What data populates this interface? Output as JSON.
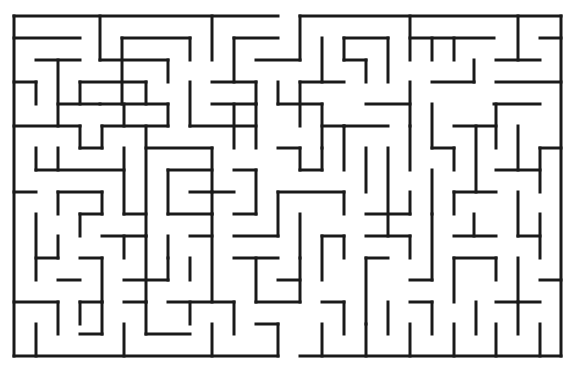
{
  "puzzle": {
    "type": "maze",
    "title": "Maze",
    "wall_color": "#1a1a1a",
    "background_color": "#ffffff",
    "entrance": {
      "side": "top",
      "x_range": [
        278,
        300
      ]
    },
    "exit": {
      "side": "bottom",
      "x_range": [
        278,
        300
      ]
    },
    "walls": [
      [
        14,
        16,
        278,
        16
      ],
      [
        300,
        16,
        561,
        16
      ],
      [
        14,
        16,
        14,
        356
      ],
      [
        561,
        16,
        561,
        356
      ],
      [
        14,
        356,
        278,
        356
      ],
      [
        300,
        356,
        561,
        356
      ],
      [
        14,
        38,
        80,
        38
      ],
      [
        36,
        60,
        80,
        60
      ],
      [
        58,
        60,
        58,
        126
      ],
      [
        36,
        82,
        36,
        104
      ],
      [
        14,
        82,
        36,
        82
      ],
      [
        100,
        16,
        100,
        60
      ],
      [
        122,
        38,
        190,
        38
      ],
      [
        190,
        38,
        190,
        60
      ],
      [
        100,
        60,
        168,
        60
      ],
      [
        168,
        60,
        168,
        82
      ],
      [
        122,
        38,
        122,
        104
      ],
      [
        80,
        82,
        80,
        104
      ],
      [
        80,
        82,
        146,
        82
      ],
      [
        146,
        82,
        146,
        104
      ],
      [
        58,
        104,
        100,
        104
      ],
      [
        100,
        104,
        168,
        104
      ],
      [
        168,
        104,
        168,
        126
      ],
      [
        212,
        16,
        212,
        60
      ],
      [
        234,
        38,
        278,
        38
      ],
      [
        234,
        38,
        234,
        82
      ],
      [
        212,
        82,
        256,
        82
      ],
      [
        256,
        82,
        256,
        104
      ],
      [
        278,
        82,
        278,
        104
      ],
      [
        190,
        82,
        190,
        126
      ],
      [
        300,
        16,
        300,
        60
      ],
      [
        256,
        60,
        300,
        60
      ],
      [
        300,
        82,
        300,
        126
      ],
      [
        300,
        82,
        344,
        82
      ],
      [
        322,
        38,
        322,
        82
      ],
      [
        344,
        38,
        344,
        60
      ],
      [
        344,
        38,
        388,
        38
      ],
      [
        388,
        38,
        388,
        82
      ],
      [
        366,
        60,
        366,
        82
      ],
      [
        344,
        60,
        366,
        60
      ],
      [
        410,
        16,
        410,
        60
      ],
      [
        410,
        38,
        494,
        38
      ],
      [
        432,
        38,
        432,
        60
      ],
      [
        454,
        38,
        454,
        60
      ],
      [
        474,
        60,
        474,
        82
      ],
      [
        432,
        82,
        474,
        82
      ],
      [
        518,
        16,
        518,
        60
      ],
      [
        540,
        38,
        561,
        38
      ],
      [
        496,
        60,
        540,
        60
      ],
      [
        496,
        82,
        561,
        82
      ],
      [
        494,
        104,
        540,
        104
      ],
      [
        14,
        126,
        80,
        126
      ],
      [
        80,
        126,
        80,
        148
      ],
      [
        80,
        148,
        102,
        148
      ],
      [
        102,
        126,
        102,
        148
      ],
      [
        102,
        126,
        168,
        126
      ],
      [
        124,
        104,
        124,
        126
      ],
      [
        190,
        126,
        256,
        126
      ],
      [
        234,
        104,
        234,
        148
      ],
      [
        212,
        104,
        256,
        104
      ],
      [
        256,
        104,
        256,
        148
      ],
      [
        278,
        104,
        322,
        104
      ],
      [
        322,
        104,
        322,
        148
      ],
      [
        322,
        126,
        344,
        126
      ],
      [
        344,
        126,
        388,
        126
      ],
      [
        366,
        104,
        410,
        104
      ],
      [
        410,
        82,
        410,
        126
      ],
      [
        432,
        104,
        432,
        148
      ],
      [
        454,
        126,
        496,
        126
      ],
      [
        496,
        104,
        496,
        148
      ],
      [
        518,
        126,
        518,
        170
      ],
      [
        36,
        148,
        36,
        170
      ],
      [
        58,
        148,
        58,
        170
      ],
      [
        36,
        170,
        124,
        170
      ],
      [
        124,
        148,
        124,
        214
      ],
      [
        146,
        126,
        146,
        236
      ],
      [
        146,
        148,
        212,
        148
      ],
      [
        212,
        148,
        212,
        192
      ],
      [
        168,
        170,
        168,
        214
      ],
      [
        168,
        170,
        212,
        170
      ],
      [
        190,
        192,
        234,
        192
      ],
      [
        212,
        192,
        212,
        214
      ],
      [
        234,
        170,
        256,
        170
      ],
      [
        256,
        170,
        256,
        214
      ],
      [
        278,
        148,
        300,
        148
      ],
      [
        300,
        148,
        300,
        170
      ],
      [
        300,
        170,
        322,
        170
      ],
      [
        322,
        148,
        322,
        170
      ],
      [
        344,
        126,
        344,
        170
      ],
      [
        366,
        148,
        366,
        192
      ],
      [
        388,
        148,
        388,
        236
      ],
      [
        410,
        126,
        410,
        170
      ],
      [
        432,
        148,
        454,
        148
      ],
      [
        454,
        148,
        454,
        170
      ],
      [
        476,
        126,
        476,
        192
      ],
      [
        496,
        170,
        540,
        170
      ],
      [
        540,
        148,
        561,
        148
      ],
      [
        540,
        148,
        540,
        192
      ],
      [
        14,
        192,
        36,
        192
      ],
      [
        58,
        192,
        58,
        214
      ],
      [
        58,
        192,
        102,
        192
      ],
      [
        102,
        192,
        102,
        214
      ],
      [
        124,
        214,
        146,
        214
      ],
      [
        168,
        214,
        212,
        214
      ],
      [
        278,
        192,
        278,
        236
      ],
      [
        278,
        192,
        344,
        192
      ],
      [
        344,
        192,
        344,
        214
      ],
      [
        366,
        214,
        410,
        214
      ],
      [
        410,
        192,
        410,
        214
      ],
      [
        432,
        170,
        432,
        214
      ],
      [
        454,
        192,
        454,
        214
      ],
      [
        454,
        192,
        496,
        192
      ],
      [
        518,
        192,
        518,
        236
      ],
      [
        36,
        214,
        36,
        280
      ],
      [
        80,
        214,
        80,
        236
      ],
      [
        80,
        214,
        102,
        214
      ],
      [
        102,
        236,
        146,
        236
      ],
      [
        124,
        236,
        124,
        258
      ],
      [
        146,
        236,
        146,
        302
      ],
      [
        168,
        236,
        168,
        258
      ],
      [
        190,
        236,
        212,
        236
      ],
      [
        212,
        214,
        212,
        302
      ],
      [
        234,
        214,
        256,
        214
      ],
      [
        234,
        236,
        278,
        236
      ],
      [
        300,
        214,
        300,
        258
      ],
      [
        322,
        236,
        322,
        280
      ],
      [
        322,
        236,
        344,
        236
      ],
      [
        344,
        236,
        344,
        258
      ],
      [
        366,
        236,
        410,
        236
      ],
      [
        410,
        236,
        410,
        258
      ],
      [
        432,
        214,
        432,
        280
      ],
      [
        454,
        236,
        496,
        236
      ],
      [
        474,
        214,
        474,
        236
      ],
      [
        518,
        236,
        540,
        236
      ],
      [
        540,
        214,
        540,
        258
      ],
      [
        58,
        236,
        58,
        258
      ],
      [
        36,
        258,
        58,
        258
      ],
      [
        80,
        258,
        102,
        258
      ],
      [
        102,
        258,
        102,
        302
      ],
      [
        58,
        280,
        80,
        280
      ],
      [
        124,
        280,
        168,
        280
      ],
      [
        168,
        258,
        168,
        280
      ],
      [
        190,
        258,
        190,
        280
      ],
      [
        234,
        258,
        278,
        258
      ],
      [
        256,
        258,
        256,
        302
      ],
      [
        278,
        280,
        300,
        280
      ],
      [
        300,
        258,
        300,
        302
      ],
      [
        366,
        258,
        388,
        258
      ],
      [
        366,
        258,
        366,
        324
      ],
      [
        410,
        280,
        432,
        280
      ],
      [
        454,
        258,
        454,
        302
      ],
      [
        454,
        258,
        496,
        258
      ],
      [
        496,
        258,
        496,
        280
      ],
      [
        518,
        258,
        518,
        302
      ],
      [
        540,
        280,
        561,
        280
      ],
      [
        14,
        302,
        58,
        302
      ],
      [
        58,
        302,
        58,
        334
      ],
      [
        80,
        302,
        102,
        302
      ],
      [
        80,
        302,
        80,
        324
      ],
      [
        102,
        302,
        102,
        334
      ],
      [
        124,
        302,
        146,
        302
      ],
      [
        146,
        302,
        146,
        334
      ],
      [
        168,
        302,
        234,
        302
      ],
      [
        190,
        302,
        190,
        324
      ],
      [
        234,
        302,
        234,
        334
      ],
      [
        256,
        302,
        300,
        302
      ],
      [
        322,
        302,
        344,
        302
      ],
      [
        344,
        302,
        344,
        334
      ],
      [
        388,
        302,
        388,
        334
      ],
      [
        410,
        302,
        432,
        302
      ],
      [
        432,
        302,
        432,
        334
      ],
      [
        476,
        302,
        476,
        334
      ],
      [
        496,
        302,
        540,
        302
      ],
      [
        518,
        302,
        518,
        334
      ],
      [
        36,
        324,
        36,
        356
      ],
      [
        80,
        334,
        102,
        334
      ],
      [
        124,
        324,
        124,
        356
      ],
      [
        146,
        334,
        190,
        334
      ],
      [
        212,
        324,
        212,
        356
      ],
      [
        256,
        324,
        278,
        324
      ],
      [
        278,
        324,
        278,
        356
      ],
      [
        322,
        324,
        322,
        356
      ],
      [
        366,
        324,
        366,
        356
      ],
      [
        410,
        324,
        410,
        356
      ],
      [
        454,
        324,
        454,
        356
      ],
      [
        496,
        324,
        496,
        356
      ],
      [
        540,
        324,
        540,
        356
      ]
    ]
  }
}
